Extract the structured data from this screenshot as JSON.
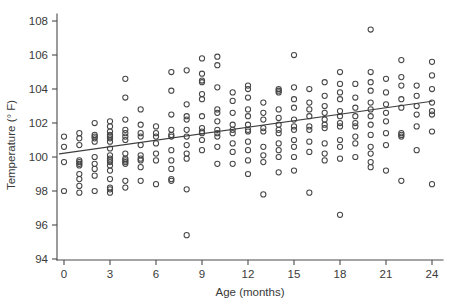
{
  "chart_data": {
    "type": "scatter",
    "title": "",
    "subtitle": "",
    "xlabel": "Age (months)",
    "ylabel": "Temperature (° F)",
    "xlim": [
      -0.9,
      25.0
    ],
    "ylim": [
      93.3,
      108.6
    ],
    "xticks": [
      0,
      3,
      6,
      9,
      12,
      15,
      18,
      21,
      24
    ],
    "yticks": [
      94,
      96,
      98,
      100,
      102,
      104,
      106,
      108
    ],
    "xtick_labels": [
      "0",
      "3",
      "6",
      "9",
      "12",
      "15",
      "18",
      "21",
      "24"
    ],
    "ytick_labels": [
      "94",
      "96",
      "98",
      "100",
      "102",
      "104",
      "106",
      "108"
    ],
    "grid": false,
    "legend": null,
    "marker": "open-circle",
    "marker_color": "#474747",
    "line_color": "#3d3d3d",
    "background_color": "#ffffff",
    "annotations": [],
    "series": [
      {
        "name": "Patient temperature by age",
        "type": "scatter",
        "points": [
          [
            0,
            101.2
          ],
          [
            0,
            100.6
          ],
          [
            0,
            99.7
          ],
          [
            0,
            98.0
          ],
          [
            1,
            101.4
          ],
          [
            1,
            101.1
          ],
          [
            1,
            100.7
          ],
          [
            1,
            99.8
          ],
          [
            1,
            99.7
          ],
          [
            1,
            99.6
          ],
          [
            1,
            99.5
          ],
          [
            1,
            99.0
          ],
          [
            1,
            98.7
          ],
          [
            1,
            98.3
          ],
          [
            1,
            97.9
          ],
          [
            2,
            102.0
          ],
          [
            2,
            101.3
          ],
          [
            2,
            101.2
          ],
          [
            2,
            101.1
          ],
          [
            2,
            100.9
          ],
          [
            2,
            100.0
          ],
          [
            2,
            99.6
          ],
          [
            2,
            99.3
          ],
          [
            2,
            98.9
          ],
          [
            2,
            98.0
          ],
          [
            3,
            102.1
          ],
          [
            3,
            101.8
          ],
          [
            3,
            101.5
          ],
          [
            3,
            101.3
          ],
          [
            3,
            101.2
          ],
          [
            3,
            101.1
          ],
          [
            3,
            100.9
          ],
          [
            3,
            100.5
          ],
          [
            3,
            100.1
          ],
          [
            3,
            99.9
          ],
          [
            3,
            99.8
          ],
          [
            3,
            99.7
          ],
          [
            3,
            99.5
          ],
          [
            3,
            99.2
          ],
          [
            3,
            98.7
          ],
          [
            3,
            98.2
          ],
          [
            3,
            98.1
          ],
          [
            3,
            97.9
          ],
          [
            4,
            104.6
          ],
          [
            4,
            103.5
          ],
          [
            4,
            102.2
          ],
          [
            4,
            101.6
          ],
          [
            4,
            101.4
          ],
          [
            4,
            101.2
          ],
          [
            4,
            101.0
          ],
          [
            4,
            100.2
          ],
          [
            4,
            99.9
          ],
          [
            4,
            99.8
          ],
          [
            4,
            99.7
          ],
          [
            4,
            99.6
          ],
          [
            4,
            98.6
          ],
          [
            4,
            98.2
          ],
          [
            5,
            102.8
          ],
          [
            5,
            101.9
          ],
          [
            5,
            101.4
          ],
          [
            5,
            101.2
          ],
          [
            5,
            100.7
          ],
          [
            5,
            100.1
          ],
          [
            5,
            99.9
          ],
          [
            5,
            99.8
          ],
          [
            5,
            99.4
          ],
          [
            5,
            98.6
          ],
          [
            6,
            101.8
          ],
          [
            6,
            101.4
          ],
          [
            6,
            101.2
          ],
          [
            6,
            100.8
          ],
          [
            6,
            100.2
          ],
          [
            6,
            99.8
          ],
          [
            6,
            98.4
          ],
          [
            7,
            105.0
          ],
          [
            7,
            103.9
          ],
          [
            7,
            102.5
          ],
          [
            7,
            101.6
          ],
          [
            7,
            101.3
          ],
          [
            7,
            101.2
          ],
          [
            7,
            100.4
          ],
          [
            7,
            99.8
          ],
          [
            7,
            99.3
          ],
          [
            7,
            98.7
          ],
          [
            7,
            98.6
          ],
          [
            8,
            105.1
          ],
          [
            8,
            103.1
          ],
          [
            8,
            102.4
          ],
          [
            8,
            102.2
          ],
          [
            8,
            101.6
          ],
          [
            8,
            101.2
          ],
          [
            8,
            100.7
          ],
          [
            8,
            100.2
          ],
          [
            8,
            99.9
          ],
          [
            8,
            98.1
          ],
          [
            8,
            95.4
          ],
          [
            9,
            105.8
          ],
          [
            9,
            104.9
          ],
          [
            9,
            104.5
          ],
          [
            9,
            104.4
          ],
          [
            9,
            103.7
          ],
          [
            9,
            103.4
          ],
          [
            9,
            102.4
          ],
          [
            9,
            101.7
          ],
          [
            9,
            101.5
          ],
          [
            9,
            101.4
          ],
          [
            9,
            101.0
          ],
          [
            9,
            100.4
          ],
          [
            10,
            105.9
          ],
          [
            10,
            105.4
          ],
          [
            10,
            104.1
          ],
          [
            10,
            102.8
          ],
          [
            10,
            102.6
          ],
          [
            10,
            102.1
          ],
          [
            10,
            101.6
          ],
          [
            10,
            101.4
          ],
          [
            10,
            101.2
          ],
          [
            10,
            100.6
          ],
          [
            10,
            99.6
          ],
          [
            11,
            103.8
          ],
          [
            11,
            103.3
          ],
          [
            11,
            102.6
          ],
          [
            11,
            101.9
          ],
          [
            11,
            101.6
          ],
          [
            11,
            101.4
          ],
          [
            11,
            100.8
          ],
          [
            11,
            100.3
          ],
          [
            11,
            99.6
          ],
          [
            12,
            104.2
          ],
          [
            12,
            104.0
          ],
          [
            12,
            103.5
          ],
          [
            12,
            102.8
          ],
          [
            12,
            102.4
          ],
          [
            12,
            101.9
          ],
          [
            12,
            101.6
          ],
          [
            12,
            101.5
          ],
          [
            12,
            100.9
          ],
          [
            12,
            100.4
          ],
          [
            12,
            99.8
          ],
          [
            12,
            99.0
          ],
          [
            13,
            103.2
          ],
          [
            13,
            102.6
          ],
          [
            13,
            102.2
          ],
          [
            13,
            101.7
          ],
          [
            13,
            101.5
          ],
          [
            13,
            100.6
          ],
          [
            13,
            100.1
          ],
          [
            13,
            99.7
          ],
          [
            13,
            97.8
          ],
          [
            14,
            104.0
          ],
          [
            14,
            103.9
          ],
          [
            14,
            103.8
          ],
          [
            14,
            102.8
          ],
          [
            14,
            102.3
          ],
          [
            14,
            101.9
          ],
          [
            14,
            101.6
          ],
          [
            14,
            101.4
          ],
          [
            14,
            100.8
          ],
          [
            14,
            100.4
          ],
          [
            14,
            100.0
          ],
          [
            14,
            99.1
          ],
          [
            15,
            106.0
          ],
          [
            15,
            104.1
          ],
          [
            15,
            103.4
          ],
          [
            15,
            102.9
          ],
          [
            15,
            102.2
          ],
          [
            15,
            101.8
          ],
          [
            15,
            101.6
          ],
          [
            15,
            101.0
          ],
          [
            15,
            100.6
          ],
          [
            15,
            100.0
          ],
          [
            15,
            99.2
          ],
          [
            16,
            104.0
          ],
          [
            16,
            103.2
          ],
          [
            16,
            102.8
          ],
          [
            16,
            102.4
          ],
          [
            16,
            101.8
          ],
          [
            16,
            101.6
          ],
          [
            16,
            100.9
          ],
          [
            16,
            100.3
          ],
          [
            16,
            97.9
          ],
          [
            17,
            104.4
          ],
          [
            17,
            103.6
          ],
          [
            17,
            103.0
          ],
          [
            17,
            102.6
          ],
          [
            17,
            102.2
          ],
          [
            17,
            101.9
          ],
          [
            17,
            101.7
          ],
          [
            17,
            100.8
          ],
          [
            17,
            100.2
          ],
          [
            17,
            99.8
          ],
          [
            18,
            105.0
          ],
          [
            18,
            104.3
          ],
          [
            18,
            103.8
          ],
          [
            18,
            103.4
          ],
          [
            18,
            102.7
          ],
          [
            18,
            102.4
          ],
          [
            18,
            102.0
          ],
          [
            18,
            101.8
          ],
          [
            18,
            101.0
          ],
          [
            18,
            100.6
          ],
          [
            18,
            99.9
          ],
          [
            18,
            96.6
          ],
          [
            19,
            104.3
          ],
          [
            19,
            103.5
          ],
          [
            19,
            102.9
          ],
          [
            19,
            102.4
          ],
          [
            19,
            102.0
          ],
          [
            19,
            101.8
          ],
          [
            19,
            101.2
          ],
          [
            19,
            100.8
          ],
          [
            19,
            100.0
          ],
          [
            20,
            107.5
          ],
          [
            20,
            105.0
          ],
          [
            20,
            104.4
          ],
          [
            20,
            103.9
          ],
          [
            20,
            103.2
          ],
          [
            20,
            102.8
          ],
          [
            20,
            102.4
          ],
          [
            20,
            101.9
          ],
          [
            20,
            101.3
          ],
          [
            20,
            100.6
          ],
          [
            20,
            100.2
          ],
          [
            20,
            99.7
          ],
          [
            20,
            99.4
          ],
          [
            21,
            104.6
          ],
          [
            21,
            103.8
          ],
          [
            21,
            103.1
          ],
          [
            21,
            102.6
          ],
          [
            21,
            102.1
          ],
          [
            21,
            101.4
          ],
          [
            21,
            100.7
          ],
          [
            21,
            99.2
          ],
          [
            22,
            105.7
          ],
          [
            22,
            104.7
          ],
          [
            22,
            104.2
          ],
          [
            22,
            103.4
          ],
          [
            22,
            102.9
          ],
          [
            22,
            101.4
          ],
          [
            22,
            101.3
          ],
          [
            22,
            101.2
          ],
          [
            22,
            98.6
          ],
          [
            23,
            104.2
          ],
          [
            23,
            103.6
          ],
          [
            23,
            103.0
          ],
          [
            23,
            102.5
          ],
          [
            23,
            101.8
          ],
          [
            23,
            100.4
          ],
          [
            24,
            105.6
          ],
          [
            24,
            104.8
          ],
          [
            24,
            104.0
          ],
          [
            24,
            103.2
          ],
          [
            24,
            102.7
          ],
          [
            24,
            102.5
          ],
          [
            24,
            101.5
          ],
          [
            24,
            98.4
          ]
        ]
      },
      {
        "name": "Least-squares regression line",
        "type": "line",
        "x_start": -0.3,
        "y_start": 100.18,
        "x_end": 24.0,
        "y_end": 103.28
      }
    ]
  }
}
